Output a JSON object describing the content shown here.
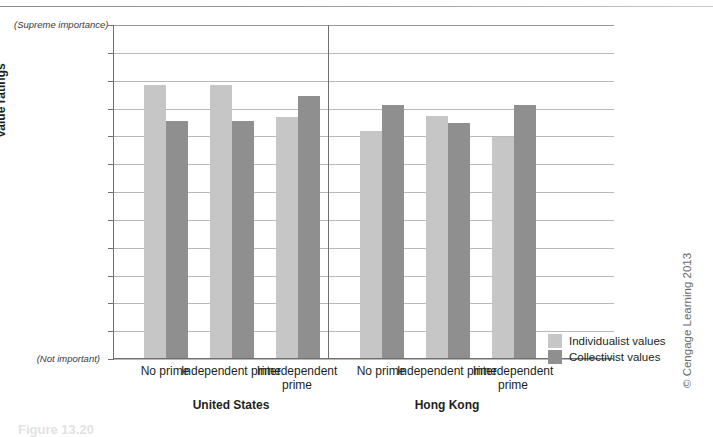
{
  "chart_data": {
    "type": "bar",
    "title": "",
    "xlabel": "",
    "ylabel": "Value ratings",
    "ylim": [
      1,
      7
    ],
    "ytick_step": 0.5,
    "yticks": [
      "7",
      "6.5",
      "6",
      "5.5",
      "5",
      "4.5",
      "4",
      "3.5",
      "3",
      "2.5",
      "2",
      "1.5",
      "1"
    ],
    "grid": true,
    "legend_position": "right",
    "axis_endpoint_notes": {
      "top": "(Supreme importance)",
      "bottom": "(Not important)"
    },
    "panels": [
      {
        "name": "United States",
        "categories": [
          "No prime",
          "Independent prime",
          "Interdependent prime"
        ]
      },
      {
        "name": "Hong Kong",
        "categories": [
          "No prime",
          "Independent prime",
          "Interdependent prime"
        ]
      }
    ],
    "categories": [
      "No prime",
      "Independent prime",
      "Interdependent prime",
      "No prime",
      "Independent prime",
      "Interdependent prime"
    ],
    "series": [
      {
        "name": "Individualist values",
        "color": "#c6c6c6",
        "values": [
          5.9,
          5.9,
          5.33,
          5.08,
          5.35,
          4.97
        ]
      },
      {
        "name": "Collectivist values",
        "color": "#8f8f8f",
        "values": [
          5.26,
          5.26,
          5.7,
          5.54,
          5.22,
          5.55
        ]
      }
    ]
  },
  "legend": {
    "items": [
      {
        "label": "Individualist values",
        "swatch": "light"
      },
      {
        "label": "Collectivist values",
        "swatch": "dark"
      }
    ]
  },
  "credit": {
    "text": "© Cengage Learning 2013"
  },
  "footer_ghost": {
    "text": "Figure 13.20"
  }
}
